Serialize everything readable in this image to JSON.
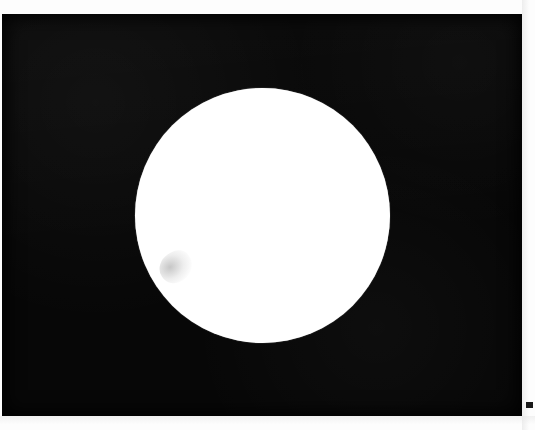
{
  "image": {
    "kind": "scanned-high-contrast-photograph",
    "subject": "white-disc-on-black-field",
    "width_px": 535,
    "height_px": 430,
    "alt_text": "A large solid white circle centered on a solid black rectangular field, surrounded by thin white paper margins on the top, right and bottom edges."
  },
  "colors": {
    "paper_white": "#fdfdfd",
    "field_black": "#070707",
    "disc_white": "#ffffff",
    "tick_mark": "#1a1a1a",
    "smudge_grey": "#787878"
  },
  "regions": {
    "black_field": {
      "label": "black-field",
      "x": 2,
      "y": 14,
      "width": 520,
      "height": 402
    },
    "disc": {
      "label": "white-disc",
      "center_x": 262,
      "center_y": 215,
      "diameter": 255,
      "radius": 127
    },
    "top_margin": {
      "label": "top-paper-margin",
      "height": 14
    },
    "right_margin": {
      "label": "right-paper-margin",
      "width": 13
    },
    "bottom_margin": {
      "label": "bottom-paper-margin",
      "height": 14
    },
    "tick_mark": {
      "label": "registration-tick-mark",
      "x": 526,
      "y": 402,
      "width": 7,
      "height": 6
    },
    "smudge": {
      "label": "disc-smudge",
      "x": 159,
      "y": 252,
      "width": 34,
      "height": 30
    }
  }
}
